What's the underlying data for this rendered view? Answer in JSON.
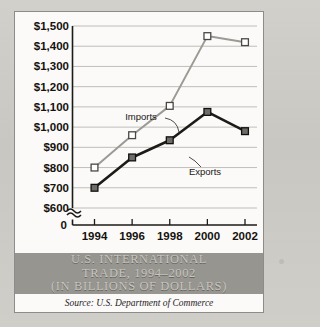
{
  "figure": {
    "title_lines": [
      "U.S. INTERNATIONAL",
      "TRADE, 1994–2002",
      "(IN BILLIONS OF DOLLARS)"
    ],
    "source": "Source: U.S. Department of Commerce",
    "band_color": "#97958f",
    "panel_color": "#fbfaf8",
    "border_color": "#8e8c88"
  },
  "chart_data": {
    "type": "line",
    "title": "U.S. INTERNATIONAL TRADE, 1994–2002 (IN BILLIONS OF DOLLARS)",
    "xlabel": "",
    "ylabel": "",
    "categories": [
      "1994",
      "1996",
      "1998",
      "2000",
      "2002"
    ],
    "x_tick_labels": [
      "1994",
      "1996",
      "1998",
      "2000",
      "2002"
    ],
    "y_tick_labels": [
      "$600",
      "$700",
      "$800",
      "$900",
      "$1,000",
      "$1,100",
      "$1,200",
      "$1,300",
      "$1,400",
      "$1,500"
    ],
    "y_tick_values": [
      600,
      700,
      800,
      900,
      1000,
      1100,
      1200,
      1300,
      1400,
      1500
    ],
    "ylim": [
      600,
      1500
    ],
    "axis_break": true,
    "origin_label": "0",
    "grid": true,
    "grid_color": "#b9b7b2",
    "legend_position": "inline-annotations",
    "series": [
      {
        "name": "Imports",
        "values": [
          800,
          960,
          1105,
          1450,
          1420
        ],
        "color": "#9c9a95",
        "marker": "open-square",
        "marker_fill": "#ffffff",
        "label_x": 126,
        "label_y": 108
      },
      {
        "name": "Exports",
        "values": [
          700,
          850,
          935,
          1075,
          980
        ],
        "color": "#1d1a17",
        "marker": "filled-square",
        "marker_fill": "#6e6c68",
        "label_x": 190,
        "label_y": 163
      }
    ]
  }
}
